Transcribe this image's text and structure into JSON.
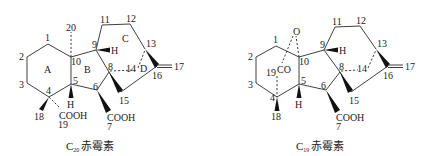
{
  "structures": [
    {
      "id": "c20",
      "caption": {
        "prefix": "C",
        "subscript": "20",
        "name": "赤霉素"
      },
      "ring_labels": [
        "A",
        "B",
        "C",
        "D"
      ],
      "atom_labels": {
        "n1": "1",
        "n2": "2",
        "n3": "3",
        "n4": "4",
        "n5": "5",
        "n6": "6",
        "n7": "7",
        "n8": "8",
        "n9": "9",
        "n10": "10",
        "n11": "11",
        "n12": "12",
        "n13": "13",
        "n14": "14",
        "n15": "15",
        "n16": "16",
        "n17": "17",
        "n18": "18",
        "n19": "19",
        "n20": "20"
      },
      "groups": {
        "h5": "H",
        "h9": "H",
        "cooh19": "COOH",
        "cooh7": "COOH"
      }
    },
    {
      "id": "c19",
      "caption": {
        "prefix": "C",
        "subscript": "19",
        "name": "赤霉素"
      },
      "atom_labels": {
        "n1": "1",
        "n2": "2",
        "n3": "3",
        "n4": "4",
        "n5": "5",
        "n6": "6",
        "n7": "7",
        "n8": "8",
        "n9": "9",
        "n10": "10",
        "n11": "11",
        "n12": "12",
        "n13": "13",
        "n14": "14",
        "n15": "15",
        "n16": "16",
        "n17": "17",
        "n18": "18",
        "n19": "19"
      },
      "groups": {
        "o": "O",
        "co": "CO",
        "h5": "H",
        "h9": "H",
        "cooh7": "COOH"
      }
    }
  ]
}
